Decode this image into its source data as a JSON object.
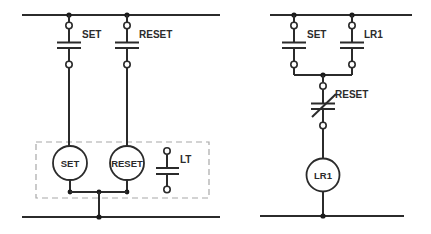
{
  "diagram": {
    "type": "ladder-logic",
    "left_circuit": {
      "contacts": [
        {
          "label": "SET",
          "type": "normally-open"
        },
        {
          "label": "RESET",
          "type": "normally-open"
        },
        {
          "label": "LT",
          "type": "normally-open"
        }
      ],
      "coils": [
        {
          "label": "SET"
        },
        {
          "label": "RESET"
        }
      ],
      "group_box": "dashed"
    },
    "right_circuit": {
      "contacts": [
        {
          "label": "SET",
          "type": "normally-open"
        },
        {
          "label": "LR1",
          "type": "normally-open"
        },
        {
          "label": "RESET",
          "type": "normally-closed"
        }
      ],
      "coils": [
        {
          "label": "LR1"
        }
      ]
    },
    "colors": {
      "line": "#2b2b2b",
      "dashed_box": "#a8a8a8",
      "background": "#ffffff"
    }
  }
}
